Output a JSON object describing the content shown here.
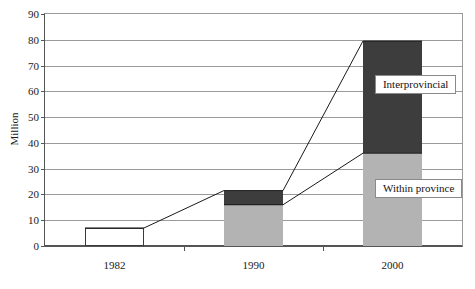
{
  "chart_data": {
    "type": "bar",
    "title": "",
    "subtitle": "",
    "xlabel": "",
    "ylabel": "Million",
    "categories": [
      "1982",
      "1990",
      "2000"
    ],
    "ylim": [
      0,
      90
    ],
    "y_ticks": [
      0,
      10,
      20,
      30,
      40,
      50,
      60,
      70,
      80,
      90
    ],
    "grid": true,
    "legend_position": "inside-right",
    "stacked": true,
    "series": [
      {
        "name": "Within province",
        "color": "#b3b3b3",
        "values": [
          7,
          16,
          36
        ]
      },
      {
        "name": "Interprovincial",
        "color": "#3d3d3d",
        "values": [
          0,
          5.5,
          43.5
        ]
      }
    ],
    "totals": [
      7,
      21.5,
      79.5
    ],
    "annotations": [
      {
        "name": "interprovincial-callout",
        "text": "Interprovincial",
        "series": "Interprovincial"
      },
      {
        "name": "within-province-callout",
        "text": "Within province",
        "series": "Within province"
      }
    ],
    "connector_lines": [
      {
        "name": "total-trend-line",
        "description": "line joining bar tops (totals)",
        "points": [
          [
            0,
            7
          ],
          [
            1,
            21.5
          ],
          [
            2,
            79.5
          ]
        ]
      },
      {
        "name": "within-province-trend-line",
        "description": "line joining within-province segment tops",
        "points": [
          [
            1,
            16
          ],
          [
            2,
            36
          ]
        ]
      }
    ]
  },
  "colors": {
    "dark_segment": "#3d3d3d",
    "light_segment": "#b3b3b3",
    "gridline": "#9a9a9a",
    "axis": "#555555",
    "text": "#1a1a1a"
  }
}
